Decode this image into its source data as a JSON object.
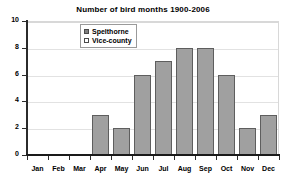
{
  "chart_data": {
    "type": "bar",
    "title": "Number of bird months 1900-2006",
    "xlabel": "",
    "ylabel": "",
    "categories": [
      "Jan",
      "Feb",
      "Mar",
      "Apr",
      "May",
      "Jun",
      "Jul",
      "Aug",
      "Sep",
      "Oct",
      "Nov",
      "Dec"
    ],
    "series": [
      {
        "name": "Spelthorne",
        "values": [
          0,
          0,
          0,
          3,
          2,
          6,
          7,
          8,
          8,
          6,
          2,
          3
        ]
      }
    ],
    "values": [
      0,
      0,
      0,
      3,
      2,
      6,
      7,
      8,
      8,
      6,
      2,
      3
    ],
    "ylim": [
      0,
      10
    ],
    "yticks": [
      0,
      2,
      4,
      6,
      8,
      10
    ],
    "ytick_labels": [
      "0",
      "2",
      "4",
      "6",
      "8",
      "10"
    ],
    "grid": true,
    "grid_axis": "y",
    "legend": {
      "position": "top-center-left",
      "entries": [
        {
          "label": "Spelthorne",
          "swatch": "dark-gray"
        },
        {
          "label": "Vice-county",
          "swatch": "light-hatched"
        }
      ]
    },
    "colors": {
      "bar_fill": "#a0a0a0",
      "bar_border": "#5e5e5e",
      "gridline": "#e2e2e2",
      "axis": "#1a1a1a",
      "background": "#ffffff",
      "text": "#000000"
    }
  }
}
